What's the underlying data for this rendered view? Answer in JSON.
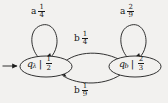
{
  "figure": {
    "kind": "probabilistic-finite-automaton-state-diagram",
    "background_color": "#f2f1ef",
    "stroke_color": "#1c1c1c",
    "text_color": "#161616"
  },
  "states": [
    {
      "id": "q-lambda",
      "name": "q",
      "subscript": "λ",
      "separator": "|",
      "value_numerator": "1",
      "value_denominator": "2",
      "is_start": true
    },
    {
      "id": "q-b",
      "name": "q",
      "subscript": "b",
      "separator": "|",
      "value_numerator": "2",
      "value_denominator": "3",
      "is_start": false
    }
  ],
  "transitions": [
    {
      "id": "self-loop-left",
      "from": "q-lambda",
      "to": "q-lambda",
      "symbol": "a",
      "numerator": "1",
      "denominator": "4"
    },
    {
      "id": "self-loop-right",
      "from": "q-b",
      "to": "q-b",
      "symbol": "a",
      "numerator": "2",
      "denominator": "9"
    },
    {
      "id": "edge-left-to-right",
      "from": "q-lambda",
      "to": "q-b",
      "symbol": "b",
      "numerator": "1",
      "denominator": "4"
    },
    {
      "id": "edge-right-to-left",
      "from": "q-b",
      "to": "q-lambda",
      "symbol": "b",
      "numerator": "1",
      "denominator": "9"
    }
  ],
  "start_marker": {
    "label": "start-arrow"
  }
}
